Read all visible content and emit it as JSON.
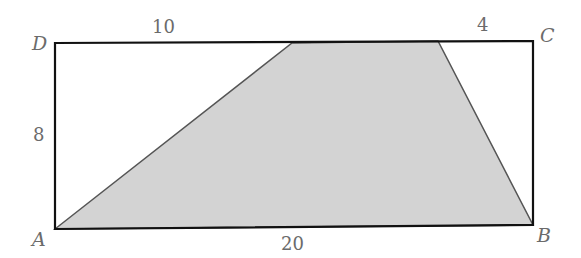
{
  "diagram": {
    "type": "geometry",
    "vertices": {
      "A": {
        "label": "A",
        "x": 55,
        "y": 229
      },
      "B": {
        "label": "B",
        "x": 533,
        "y": 225
      },
      "C": {
        "label": "C",
        "x": 533,
        "y": 41
      },
      "D": {
        "label": "D",
        "x": 55,
        "y": 43
      }
    },
    "shaded_region": {
      "points": [
        [
          55,
          229
        ],
        [
          292,
          43
        ],
        [
          438,
          41
        ],
        [
          533,
          225
        ]
      ],
      "fill": "#d3d3d3",
      "stroke": "#555555"
    },
    "measurements": {
      "top_left_segment": "10",
      "top_right_segment": "4",
      "left_side": "8",
      "bottom_side": "20"
    },
    "colors": {
      "rect_stroke": "#111111",
      "label": "#6b6b6b"
    }
  }
}
